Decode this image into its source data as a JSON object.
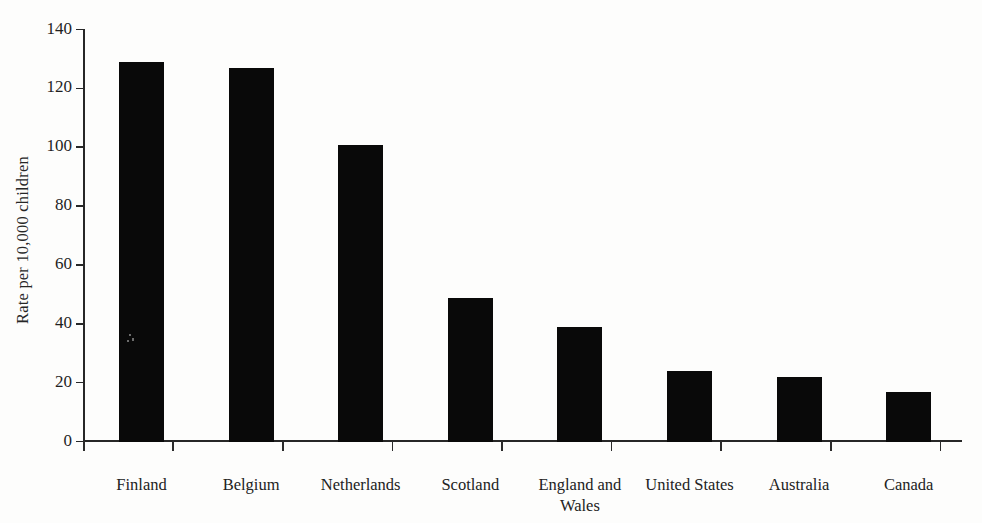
{
  "chart_data": {
    "type": "bar",
    "title": "",
    "subtitle": "",
    "xlabel": "",
    "ylabel": "Rate per 10,000 children",
    "categories": [
      "Finland",
      "Belgium",
      "Netherlands",
      "Scotland",
      "England and\nWales",
      "United States",
      "Australia",
      "Canada"
    ],
    "values": [
      129,
      127,
      101,
      49,
      39,
      24,
      22,
      17
    ],
    "ylim": [
      0,
      140
    ],
    "yticks": [
      0,
      20,
      40,
      60,
      80,
      100,
      120,
      140
    ],
    "ytick_labels": [
      "0",
      "20",
      "40",
      "60",
      "80",
      "100",
      "120",
      "140"
    ],
    "grid": false,
    "legend": null,
    "bar_color": "#090909",
    "axis_color": "#272727",
    "background_color": "#fdfdfc"
  }
}
